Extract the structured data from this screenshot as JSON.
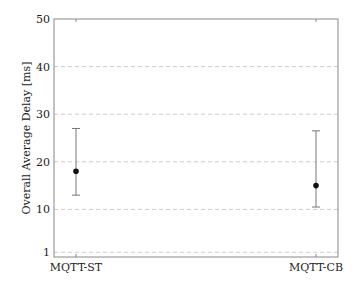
{
  "chart_data": {
    "type": "scatter",
    "subtype": "errorbar",
    "title": "",
    "xlabel": "",
    "ylabel": "Overall Average Delay [ms]",
    "categories": [
      "MQTT-ST",
      "MQTT-CB"
    ],
    "series": [
      {
        "name": "Average delay",
        "values": [
          18,
          15
        ],
        "error_low": [
          13,
          10.5
        ],
        "error_high": [
          27,
          26.5
        ]
      }
    ],
    "yticks": [
      1,
      10,
      20,
      30,
      40,
      50
    ],
    "ylim": [
      0,
      50
    ],
    "grid": {
      "y": true,
      "style": "dashed"
    },
    "legend": null
  },
  "colors": {
    "axis": "#888888",
    "grid": "#cccccc",
    "marker": "#111111",
    "errorbar": "#777777"
  }
}
